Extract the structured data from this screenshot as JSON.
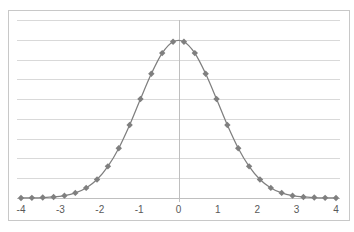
{
  "chart_data": {
    "type": "line",
    "title": "",
    "xlabel": "",
    "ylabel": "",
    "xlim": [
      -4,
      4
    ],
    "ylim": [
      0,
      0.45
    ],
    "grid": {
      "horizontal": true,
      "vertical": false,
      "y_step": 0.05
    },
    "legend": null,
    "x_ticks": [
      "-4",
      "-3",
      "-2",
      "-1",
      "0",
      "1",
      "2",
      "3",
      "4"
    ],
    "y_ticks_visible": false,
    "series": [
      {
        "name": "Normal density",
        "style": "line-with-markers",
        "color": "#7f7f7f",
        "x": [
          -4.0,
          -3.724,
          -3.448,
          -3.172,
          -2.897,
          -2.621,
          -2.345,
          -2.069,
          -1.793,
          -1.517,
          -1.241,
          -0.966,
          -0.69,
          -0.414,
          -0.138,
          0.138,
          0.414,
          0.69,
          0.966,
          1.241,
          1.517,
          1.793,
          2.069,
          2.345,
          2.621,
          2.897,
          3.172,
          3.448,
          3.724,
          4.0
        ],
        "values": [
          0.0001,
          0.0004,
          0.0011,
          0.0026,
          0.006,
          0.0129,
          0.0255,
          0.0468,
          0.08,
          0.1259,
          0.1845,
          0.2503,
          0.3141,
          0.3663,
          0.3951,
          0.3951,
          0.3663,
          0.3141,
          0.2503,
          0.1845,
          0.1259,
          0.08,
          0.0468,
          0.0255,
          0.0129,
          0.006,
          0.0026,
          0.0011,
          0.0004,
          0.0001
        ]
      }
    ]
  },
  "colors": {
    "gridline": "#d9d9d9",
    "axis": "#bfbfbf",
    "series": "#7f7f7f",
    "frame": "#c8c8c8",
    "tick_text": "#595959"
  }
}
